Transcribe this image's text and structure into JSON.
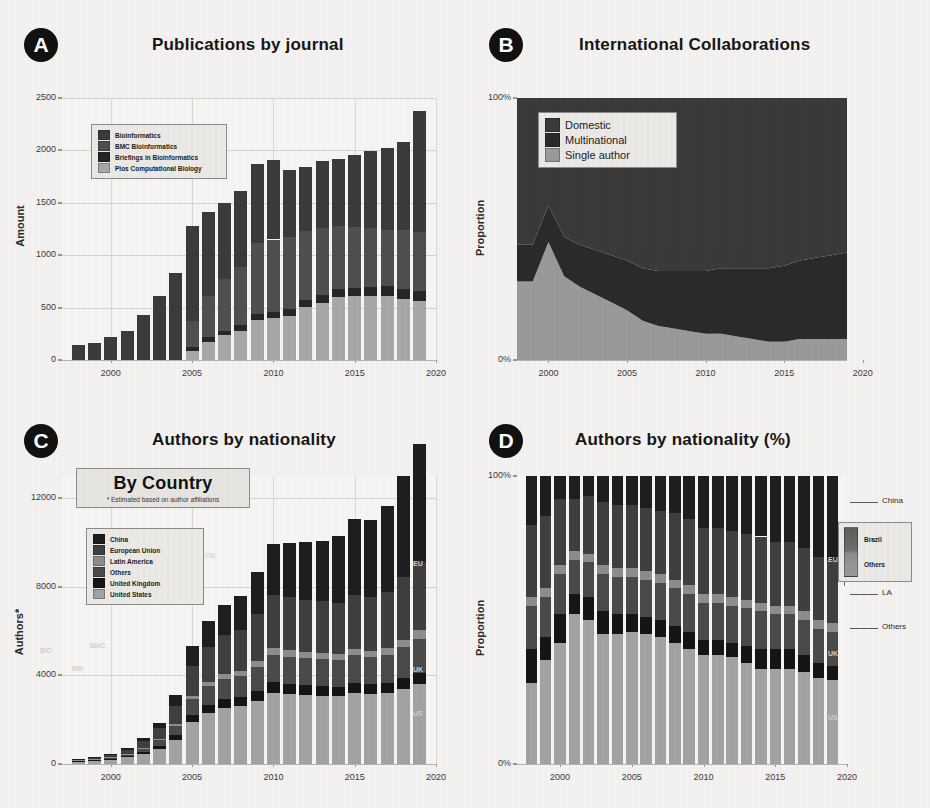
{
  "figure": {
    "background": "#f4f3f1",
    "panels": [
      "A",
      "B",
      "C",
      "D"
    ]
  },
  "panelA": {
    "badge": "A",
    "title": "Publications by journal",
    "ylabel": "Amount",
    "legend_items": [
      {
        "label": "Bioinformatics",
        "color": "#3b3b3b"
      },
      {
        "label": "BMC Bioinformatics",
        "color": "#4f4f4f"
      },
      {
        "label": "Briefings in Bioinformatics",
        "color": "#262626"
      },
      {
        "label": "Plos Computational Biology",
        "color": "#a8a8a8"
      }
    ]
  },
  "panelB": {
    "badge": "B",
    "title": "International Collaborations",
    "ylabel": "Proportion",
    "legend_items": [
      {
        "label": "Domestic",
        "color": "#3a3a3a"
      },
      {
        "label": "Multinational",
        "color": "#2a2a2a"
      },
      {
        "label": "Single author",
        "color": "#9a9a9a"
      }
    ]
  },
  "panelC": {
    "badge": "C",
    "title": "Authors by nationality",
    "ylabel": "Authors*",
    "box_title": "By Country",
    "box_note": "* Estimated based on author affiliations",
    "legend_items": [
      {
        "label": "China",
        "color": "#1e1e1e"
      },
      {
        "label": "European Union",
        "color": "#3f3f3f"
      },
      {
        "label": "Latin America",
        "color": "#8d8d8d"
      },
      {
        "label": "Others",
        "color": "#4a4a4a"
      },
      {
        "label": "United Kingdom",
        "color": "#151515"
      },
      {
        "label": "United States",
        "color": "#a3a3a3"
      }
    ],
    "inbar_labels": [
      "EU",
      "UK",
      "US"
    ],
    "ghost_labels": [
      "BIO",
      "BMC",
      "BIB",
      "PLOS"
    ]
  },
  "panelD": {
    "badge": "D",
    "title": "Authors by nationality (%)",
    "ylabel": "Proportion",
    "annotations": [
      "China",
      "LA",
      "Others"
    ],
    "inbar_labels": [
      "EU",
      "UK",
      "US"
    ],
    "inset_legend": [
      {
        "label": "Brazil",
        "color": "#6e6e6e"
      },
      {
        "label": "Others",
        "color": "#8f8f8f"
      }
    ]
  },
  "chart_data": [
    {
      "id": "A",
      "type": "bar",
      "stacked": true,
      "title": "Publications by journal",
      "xlabel": "",
      "ylabel": "Amount",
      "ylim": [
        0,
        2500
      ],
      "yticks": [
        0,
        500,
        1000,
        1500,
        2000,
        2500
      ],
      "xticks": [
        2000,
        2005,
        2010,
        2015,
        2020
      ],
      "xlim": [
        1997,
        2020
      ],
      "grid": true,
      "legend_position": "upper-left-inside",
      "categories": [
        1998,
        1999,
        2000,
        2001,
        2002,
        2003,
        2004,
        2005,
        2006,
        2007,
        2008,
        2009,
        2010,
        2011,
        2012,
        2013,
        2014,
        2015,
        2016,
        2017,
        2018,
        2019
      ],
      "series": [
        {
          "name": "Plos Computational Biology",
          "color": "#a8a8a8",
          "values": [
            0,
            0,
            0,
            0,
            0,
            0,
            0,
            90,
            175,
            235,
            280,
            380,
            400,
            420,
            505,
            545,
            600,
            610,
            615,
            615,
            585,
            560
          ]
        },
        {
          "name": "Briefings in Bioinformatics",
          "color": "#262626",
          "values": [
            0,
            0,
            0,
            0,
            0,
            0,
            0,
            30,
            40,
            45,
            50,
            55,
            60,
            65,
            70,
            75,
            80,
            80,
            85,
            90,
            95,
            95
          ]
        },
        {
          "name": "BMC Bioinformatics",
          "color": "#4f4f4f",
          "values": [
            0,
            0,
            0,
            0,
            0,
            0,
            0,
            250,
            400,
            490,
            560,
            680,
            690,
            690,
            660,
            640,
            600,
            580,
            560,
            540,
            560,
            565
          ]
        },
        {
          "name": "Bioinformatics",
          "color": "#3b3b3b",
          "values": [
            145,
            160,
            215,
            275,
            430,
            615,
            835,
            910,
            800,
            730,
            720,
            755,
            755,
            640,
            610,
            635,
            640,
            690,
            730,
            775,
            840,
            1160
          ]
        }
      ],
      "totals": [
        145,
        160,
        215,
        275,
        430,
        615,
        835,
        1280,
        1415,
        1500,
        1610,
        1870,
        1905,
        1815,
        1845,
        1895,
        1920,
        1960,
        1990,
        2020,
        2080,
        2380
      ]
    },
    {
      "id": "B",
      "type": "area",
      "stacked": true,
      "normalized": true,
      "title": "International Collaborations",
      "xlabel": "",
      "ylabel": "Proportion",
      "ylim": [
        0,
        100
      ],
      "yticks": [
        0,
        100
      ],
      "ytick_labels": [
        "0%",
        "100%"
      ],
      "xticks": [
        2000,
        2005,
        2010,
        2015,
        2020
      ],
      "xlim": [
        1998,
        2019
      ],
      "grid": false,
      "legend_position": "upper-left-inside",
      "x": [
        1998,
        1999,
        2000,
        2001,
        2002,
        2003,
        2004,
        2005,
        2006,
        2007,
        2008,
        2009,
        2010,
        2011,
        2012,
        2013,
        2014,
        2015,
        2016,
        2017,
        2018,
        2019
      ],
      "series": [
        {
          "name": "Single author",
          "color": "#9a9a9a",
          "values": [
            30,
            30,
            45,
            32,
            28,
            25,
            22,
            19,
            15,
            13,
            12,
            11,
            10,
            10,
            9,
            8,
            7,
            7,
            8,
            8,
            8,
            8
          ]
        },
        {
          "name": "Multinational",
          "color": "#2a2a2a",
          "values": [
            14,
            14,
            14,
            15,
            16,
            17,
            18,
            19,
            20,
            21,
            22,
            23,
            24,
            25,
            26,
            27,
            28,
            29,
            30,
            31,
            32,
            33
          ]
        },
        {
          "name": "Domestic",
          "color": "#3a3a3a",
          "values": [
            56,
            56,
            41,
            53,
            56,
            58,
            60,
            62,
            65,
            66,
            66,
            66,
            66,
            65,
            65,
            65,
            65,
            64,
            62,
            61,
            60,
            59
          ]
        }
      ]
    },
    {
      "id": "C",
      "type": "bar",
      "stacked": true,
      "title": "Authors by nationality",
      "xlabel": "",
      "ylabel": "Authors*",
      "ylim": [
        0,
        13000
      ],
      "yticks": [
        0,
        4000,
        8000,
        12000
      ],
      "xticks": [
        2000,
        2005,
        2010,
        2015,
        2020
      ],
      "xlim": [
        1997,
        2020
      ],
      "grid": true,
      "legend_position": "upper-left-inside",
      "categories": [
        1998,
        1999,
        2000,
        2001,
        2002,
        2003,
        2004,
        2005,
        2006,
        2007,
        2008,
        2009,
        2010,
        2011,
        2012,
        2013,
        2014,
        2015,
        2016,
        2017,
        2018,
        2019
      ],
      "series": [
        {
          "name": "United States",
          "color": "#a3a3a3",
          "values": [
            110,
            160,
            200,
            300,
            470,
            700,
            1100,
            1900,
            2300,
            2550,
            2600,
            2850,
            3200,
            3150,
            3100,
            3080,
            3050,
            3200,
            3150,
            3200,
            3400,
            3600
          ]
        },
        {
          "name": "United Kingdom",
          "color": "#151515",
          "values": [
            20,
            25,
            35,
            50,
            80,
            130,
            210,
            330,
            380,
            400,
            420,
            450,
            480,
            470,
            460,
            450,
            440,
            450,
            440,
            450,
            470,
            490
          ]
        },
        {
          "name": "Others",
          "color": "#4a4a4a",
          "values": [
            30,
            40,
            55,
            90,
            150,
            250,
            420,
            700,
            820,
            900,
            950,
            1100,
            1250,
            1230,
            1210,
            1200,
            1190,
            1250,
            1230,
            1280,
            1400,
            1550
          ]
        },
        {
          "name": "Latin America",
          "color": "#8d8d8d",
          "values": [
            5,
            8,
            12,
            20,
            35,
            55,
            95,
            160,
            190,
            210,
            220,
            260,
            300,
            295,
            290,
            285,
            280,
            300,
            295,
            310,
            350,
            400
          ]
        },
        {
          "name": "European Union",
          "color": "#3f3f3f",
          "values": [
            60,
            80,
            110,
            180,
            300,
            480,
            800,
            1350,
            1600,
            1760,
            1840,
            2100,
            2400,
            2380,
            2360,
            2340,
            2320,
            2450,
            2420,
            2520,
            2800,
            3100
          ]
        },
        {
          "name": "China",
          "color": "#1e1e1e",
          "values": [
            15,
            25,
            40,
            70,
            130,
            250,
            480,
            900,
            1150,
            1380,
            1550,
            1900,
            2300,
            2450,
            2600,
            2700,
            3000,
            3400,
            3500,
            3900,
            4600,
            5300
          ]
        }
      ],
      "totals": [
        240,
        338,
        452,
        710,
        1165,
        1865,
        3105,
        5340,
        6440,
        7200,
        7580,
        8660,
        9930,
        9975,
        10020,
        10055,
        10280,
        11050,
        11035,
        11660,
        13020,
        14440
      ]
    },
    {
      "id": "D",
      "type": "bar",
      "stacked": true,
      "normalized": true,
      "title": "Authors by nationality (%)",
      "xlabel": "",
      "ylabel": "Proportion",
      "ylim": [
        0,
        100
      ],
      "yticks": [
        0,
        100
      ],
      "ytick_labels": [
        "0%",
        "100%"
      ],
      "xticks": [
        2000,
        2005,
        2010,
        2015,
        2020
      ],
      "xlim": [
        1997,
        2020
      ],
      "grid": false,
      "annotations": [
        "China",
        "LA",
        "Others",
        "EU",
        "UK",
        "US"
      ],
      "categories": [
        1998,
        1999,
        2000,
        2001,
        2002,
        2003,
        2004,
        2005,
        2006,
        2007,
        2008,
        2009,
        2010,
        2011,
        2012,
        2013,
        2014,
        2015,
        2016,
        2017,
        2018,
        2019
      ],
      "series": [
        {
          "name": "United States",
          "color": "#a3a3a3",
          "values": [
            28,
            36,
            42,
            52,
            50,
            45,
            45,
            46,
            45,
            44,
            42,
            40,
            38,
            38,
            37,
            35,
            33,
            33,
            33,
            32,
            30,
            29
          ]
        },
        {
          "name": "United Kingdom",
          "color": "#151515",
          "values": [
            12,
            8,
            10,
            7,
            8,
            8,
            7,
            6,
            6,
            6,
            6,
            6,
            5,
            5,
            5,
            6,
            7,
            7,
            7,
            6,
            5,
            5
          ]
        },
        {
          "name": "Others",
          "color": "#4a4a4a",
          "values": [
            15,
            14,
            14,
            12,
            12,
            13,
            13,
            13,
            13,
            13,
            13,
            13,
            13,
            13,
            13,
            13,
            13,
            12,
            12,
            12,
            12,
            12
          ]
        },
        {
          "name": "Latin America",
          "color": "#8d8d8d",
          "values": [
            3,
            3,
            3,
            3,
            3,
            3,
            3,
            3,
            3,
            3,
            3,
            3,
            3,
            3,
            3,
            3,
            3,
            3,
            3,
            3,
            3,
            3
          ]
        },
        {
          "name": "European Union",
          "color": "#3f3f3f",
          "values": [
            25,
            25,
            23,
            18,
            20,
            22,
            22,
            22,
            22,
            22,
            23,
            23,
            23,
            23,
            23,
            23,
            23,
            22,
            22,
            22,
            22,
            22
          ]
        },
        {
          "name": "China",
          "color": "#1e1e1e",
          "values": [
            17,
            14,
            8,
            8,
            7,
            9,
            10,
            10,
            11,
            12,
            13,
            15,
            18,
            18,
            19,
            20,
            21,
            23,
            23,
            25,
            28,
            29
          ]
        }
      ]
    }
  ]
}
